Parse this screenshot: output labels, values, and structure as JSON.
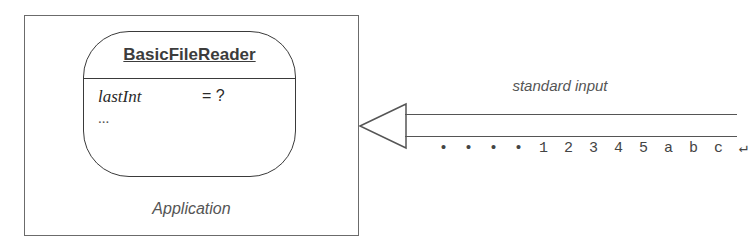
{
  "diagram": {
    "application_box": {
      "label": "Application"
    },
    "object": {
      "class_name": "BasicFileReader",
      "fields": [
        {
          "name": "lastInt",
          "value": "= ?"
        }
      ],
      "more": "..."
    },
    "stream": {
      "label": "standard input",
      "chars": [
        "•",
        "•",
        "•",
        "•",
        "1",
        "2",
        "3",
        "4",
        "5",
        "a",
        "b",
        "c",
        "↵"
      ]
    },
    "colors": {
      "stroke": "#555555",
      "text": "#444444"
    }
  }
}
